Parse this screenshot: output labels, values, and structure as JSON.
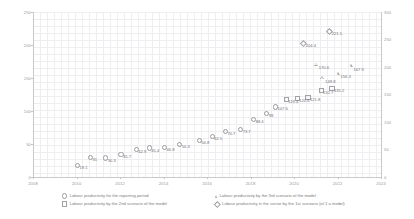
{
  "chart_data": {
    "type": "scatter",
    "title": "",
    "xlabel": "",
    "ylabel": "",
    "grid": true,
    "legend_position": "bottom",
    "xlim": [
      2008,
      2024
    ],
    "x_ticks": [
      "2008",
      "2010",
      "2012",
      "2014",
      "2016",
      "2018",
      "2020",
      "2022",
      "2024"
    ],
    "ylim_left": [
      0,
      250
    ],
    "y_ticks_left": [
      "250",
      "200",
      "150",
      "100",
      "50",
      "0"
    ],
    "ylim_right": [
      0,
      300
    ],
    "y_ticks_right": [
      "300",
      "250",
      "200",
      "150",
      "100",
      "50",
      "0"
    ],
    "series": [
      {
        "name": "Labour productivity for the reporting period",
        "marker": "circle",
        "points": [
          {
            "x": 2010.0,
            "y": 19.1,
            "label": "19.1"
          },
          {
            "x": 2010.6,
            "y": 31.0,
            "label": "31"
          },
          {
            "x": 2011.3,
            "y": 30.3,
            "label": "30.3"
          },
          {
            "x": 2012.0,
            "y": 35.7,
            "label": "35.7"
          },
          {
            "x": 2012.7,
            "y": 42.9,
            "label": "42.9"
          },
          {
            "x": 2013.3,
            "y": 45.4,
            "label": "45.4"
          },
          {
            "x": 2014.0,
            "y": 46.8,
            "label": "46.8"
          },
          {
            "x": 2014.7,
            "y": 50.3,
            "label": "50.3"
          },
          {
            "x": 2015.6,
            "y": 56.8,
            "label": "56.8"
          },
          {
            "x": 2016.2,
            "y": 62.5,
            "label": "62.5"
          },
          {
            "x": 2016.8,
            "y": 70.7,
            "label": "70.7"
          },
          {
            "x": 2017.5,
            "y": 73.7,
            "label": "73.7"
          },
          {
            "x": 2018.1,
            "y": 88.4,
            "label": "88.4"
          },
          {
            "x": 2018.7,
            "y": 98.0,
            "label": "98"
          },
          {
            "x": 2019.1,
            "y": 107.6,
            "label": "107.6"
          }
        ]
      },
      {
        "name": "Labour productivity by the 2nd scenario of the model",
        "marker": "square",
        "points": [
          {
            "x": 2019.6,
            "y": 119.4,
            "label": "119.4"
          },
          {
            "x": 2020.1,
            "y": 120.6,
            "label": "120.6"
          },
          {
            "x": 2020.6,
            "y": 121.8,
            "label": "121.8"
          },
          {
            "x": 2021.2,
            "y": 132.7,
            "label": "132.7"
          },
          {
            "x": 2021.7,
            "y": 135.2,
            "label": "135.2"
          }
        ]
      },
      {
        "name": "Labour productivity by the 3rd scenario of the model",
        "marker": "triangle",
        "points": [
          {
            "x": 2021.3,
            "y": 149.8,
            "label": "149.8"
          },
          {
            "x": 2021.0,
            "y": 170.6,
            "label": "170.6"
          },
          {
            "x": 2022.0,
            "y": 156.3,
            "label": "156.3"
          },
          {
            "x": 2022.6,
            "y": 167.9,
            "label": "167.9"
          }
        ]
      },
      {
        "name": "Labour productivity in the sector by the 1st scenario (of 1 a model)",
        "marker": "diamond",
        "points": [
          {
            "x": 2020.4,
            "y": 204.4,
            "label": "204.4"
          },
          {
            "x": 2021.6,
            "y": 221.5,
            "label": "221.5"
          },
          {
            "x": 2022.9,
            "y": 275.0,
            "label": "275"
          }
        ]
      }
    ]
  },
  "legend": {
    "items": [
      {
        "label": "Labour productivity for the reporting period",
        "marker": "circle"
      },
      {
        "label": "Labour productivity by the 2nd scenario of the model",
        "marker": "square"
      },
      {
        "label": "Labour productivity by the 3rd scenario of the model",
        "marker": "triangle"
      },
      {
        "label": "Labour productivity in the sector by the 1st scenario (of 1 a model)",
        "marker": "diamond"
      }
    ]
  }
}
